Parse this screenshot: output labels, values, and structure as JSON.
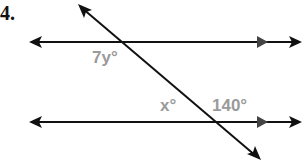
{
  "problem": {
    "number": "4."
  },
  "labels": {
    "top_angle": "7y°",
    "bottom_left_angle": "x°",
    "bottom_right_angle": "140°"
  },
  "colors": {
    "line": "#111111",
    "label": "#9a9a9a"
  }
}
